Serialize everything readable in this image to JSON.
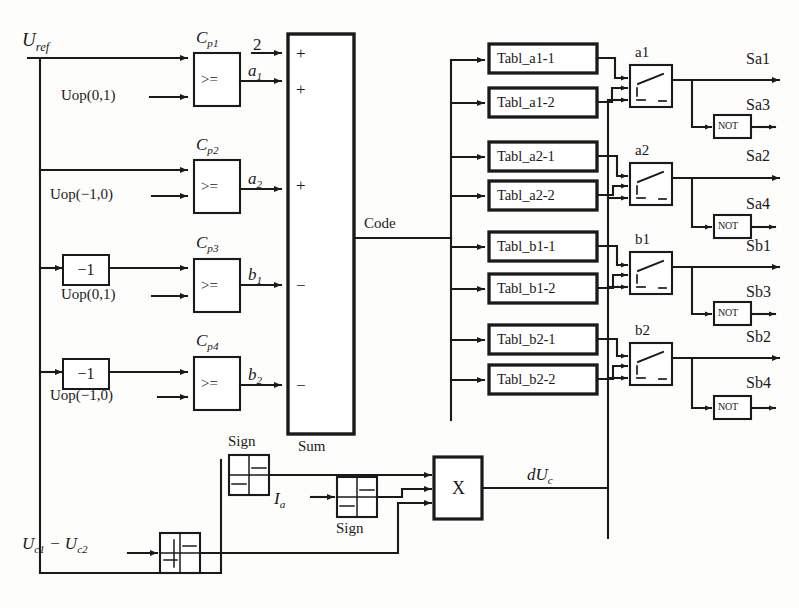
{
  "diagram": {
    "inputs": {
      "u_ref": "U",
      "u_ref_sub": "ref",
      "ia": "I",
      "ia_sub": "a",
      "uc_diff_1": "U",
      "uc_diff_1_sub": "c1",
      "uc_diff_minus": " − ",
      "uc_diff_2": "U",
      "uc_diff_2_sub": "c2"
    },
    "operating_points": [
      {
        "name": "uop-0-1-top",
        "label": "Uop(0,1)"
      },
      {
        "name": "uop-m1-0-top",
        "label": "Uop(−1,0)"
      },
      {
        "name": "uop-0-1-bottom",
        "label": "Uop(0,1)"
      },
      {
        "name": "uop-m1-0-bottom",
        "label": "Uop(−1,0)"
      }
    ],
    "gain_blocks": [
      {
        "name": "gain-minus-one-1",
        "label": "−1"
      },
      {
        "name": "gain-minus-one-2",
        "label": "−1"
      }
    ],
    "comparators": [
      {
        "name": "cp1",
        "label": "C",
        "sub": "p1",
        "op": ">=",
        "out": "a",
        "out_sub": "1"
      },
      {
        "name": "cp2",
        "label": "C",
        "sub": "p2",
        "op": ">=",
        "out": "a",
        "out_sub": "2"
      },
      {
        "name": "cp3",
        "label": "C",
        "sub": "p3",
        "op": ">=",
        "out": "b",
        "out_sub": "1"
      },
      {
        "name": "cp4",
        "label": "C",
        "sub": "p4",
        "op": ">=",
        "out": "b",
        "out_sub": "2"
      }
    ],
    "constant_input": "2",
    "sum_block": {
      "name": "sum",
      "label": "Sum",
      "signs": [
        "+",
        "+",
        "+",
        "−",
        "−"
      ],
      "output_label": "Code"
    },
    "table_blocks": [
      {
        "name": "tabl-a1-1",
        "label": "Tabl_a1-1"
      },
      {
        "name": "tabl-a1-2",
        "label": "Tabl_a1-2"
      },
      {
        "name": "tabl-a2-1",
        "label": "Tabl_a2-1"
      },
      {
        "name": "tabl-a2-2",
        "label": "Tabl_a2-2"
      },
      {
        "name": "tabl-b1-1",
        "label": "Tabl_b1-1"
      },
      {
        "name": "tabl-b1-2",
        "label": "Tabl_b1-2"
      },
      {
        "name": "tabl-b2-1",
        "label": "Tabl_b2-1"
      },
      {
        "name": "tabl-b2-2",
        "label": "Tabl_b2-2"
      }
    ],
    "switches": [
      {
        "name": "switch-a1",
        "label": "a1"
      },
      {
        "name": "switch-a2",
        "label": "a2"
      },
      {
        "name": "switch-b1",
        "label": "b1"
      },
      {
        "name": "switch-b2",
        "label": "b2"
      }
    ],
    "not_gates": [
      {
        "name": "not-sa3",
        "label": "NOT"
      },
      {
        "name": "not-sa4",
        "label": "NOT"
      },
      {
        "name": "not-sb3",
        "label": "NOT"
      },
      {
        "name": "not-sb4",
        "label": "NOT"
      }
    ],
    "outputs": [
      {
        "name": "output-sa1",
        "label": "Sa1"
      },
      {
        "name": "output-sa3",
        "label": "Sa3"
      },
      {
        "name": "output-sa2",
        "label": "Sa2"
      },
      {
        "name": "output-sa4",
        "label": "Sa4"
      },
      {
        "name": "output-sb1",
        "label": "Sb1"
      },
      {
        "name": "output-sb3",
        "label": "Sb3"
      },
      {
        "name": "output-sb2",
        "label": "Sb2"
      },
      {
        "name": "output-sb4",
        "label": "Sb4"
      }
    ],
    "sign_blocks": [
      {
        "name": "sign-top",
        "label": "Sign"
      },
      {
        "name": "sign-middle",
        "label": "Sign"
      }
    ],
    "relay_block": {
      "name": "relay-uc",
      "label": ""
    },
    "multiplier": {
      "name": "multiplier",
      "label": "X"
    },
    "feedback": {
      "name": "du-c",
      "label": "dU",
      "sub": "c"
    },
    "colors": {
      "line": "#1a1a1a",
      "text": "#1a1a1a",
      "background": "#fdfdfb",
      "block_fill": "#ffffff"
    }
  }
}
